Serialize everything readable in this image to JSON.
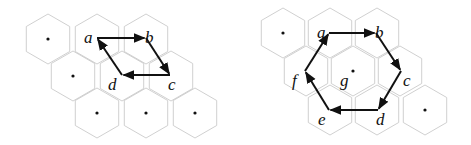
{
  "left_panel": {
    "hex_radius": 25,
    "cells": [
      {
        "cx": 48,
        "cy": 39,
        "dot": true
      },
      {
        "cx": 97,
        "cy": 39,
        "dot": false
      },
      {
        "cx": 146,
        "cy": 39,
        "dot": false
      },
      {
        "cx": 73,
        "cy": 76,
        "dot": true
      },
      {
        "cx": 122,
        "cy": 76,
        "dot": false
      },
      {
        "cx": 171,
        "cy": 76,
        "dot": false
      },
      {
        "cx": 97,
        "cy": 113,
        "dot": true
      },
      {
        "cx": 146,
        "cy": 113,
        "dot": true
      },
      {
        "cx": 195,
        "cy": 113,
        "dot": true
      }
    ],
    "vertices": [
      {
        "id": "a",
        "x": 97,
        "y": 38,
        "lx": 84,
        "ly": 43
      },
      {
        "id": "b",
        "x": 146,
        "y": 38,
        "lx": 145,
        "ly": 43
      },
      {
        "id": "c",
        "x": 170,
        "y": 75,
        "lx": 168,
        "ly": 90
      },
      {
        "id": "d",
        "x": 122,
        "y": 75,
        "lx": 108,
        "ly": 90
      }
    ],
    "edges": [
      [
        "a",
        "b"
      ],
      [
        "b",
        "c"
      ],
      [
        "c",
        "d"
      ],
      [
        "d",
        "a"
      ]
    ],
    "labels": {
      "a": "a",
      "b": "b",
      "c": "c",
      "d": "d"
    }
  },
  "right_panel": {
    "hex_radius": 25,
    "cells": [
      {
        "cx": 283,
        "cy": 33,
        "dot": true
      },
      {
        "cx": 330,
        "cy": 33,
        "dot": false
      },
      {
        "cx": 377,
        "cy": 33,
        "dot": false
      },
      {
        "cx": 306,
        "cy": 71,
        "dot": false
      },
      {
        "cx": 353,
        "cy": 71,
        "dot": true
      },
      {
        "cx": 400,
        "cy": 71,
        "dot": false
      },
      {
        "cx": 330,
        "cy": 110,
        "dot": false
      },
      {
        "cx": 377,
        "cy": 110,
        "dot": false
      },
      {
        "cx": 425,
        "cy": 110,
        "dot": true
      }
    ],
    "vertices": [
      {
        "id": "a",
        "x": 329,
        "y": 33,
        "lx": 317,
        "ly": 38
      },
      {
        "id": "b",
        "x": 376,
        "y": 33,
        "lx": 375,
        "ly": 38
      },
      {
        "id": "c",
        "x": 401,
        "y": 71,
        "lx": 403,
        "ly": 86
      },
      {
        "id": "d",
        "x": 378,
        "y": 110,
        "lx": 376,
        "ly": 125
      },
      {
        "id": "e",
        "x": 329,
        "y": 110,
        "lx": 318,
        "ly": 125
      },
      {
        "id": "f",
        "x": 305,
        "y": 71,
        "lx": 292,
        "ly": 86
      }
    ],
    "edges": [
      [
        "a",
        "b"
      ],
      [
        "b",
        "c"
      ],
      [
        "c",
        "d"
      ],
      [
        "d",
        "e"
      ],
      [
        "e",
        "f"
      ],
      [
        "f",
        "a"
      ]
    ],
    "center_label": {
      "text": "g",
      "x": 340,
      "y": 86
    },
    "labels": {
      "a": "a",
      "b": "b",
      "c": "c",
      "d": "d",
      "e": "e",
      "f": "f",
      "g": "g"
    }
  }
}
